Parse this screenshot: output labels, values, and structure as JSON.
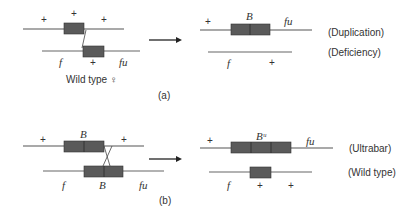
{
  "colors": {
    "line": "#666666",
    "box": "#5a5a5a",
    "box_border": "#333333",
    "text": "#333333"
  },
  "panel_a": {
    "label": "(a)",
    "caption": "Wild type ♀",
    "left": {
      "top_markers": [
        "+",
        "+",
        "+"
      ],
      "bottom_markers": [
        "f",
        "+",
        "fu"
      ]
    },
    "right": {
      "top_markers": [
        "+",
        "B",
        "fu"
      ],
      "bottom_markers": [
        "f",
        "+"
      ],
      "top_result": "(Duplication)",
      "bottom_result": "(Deficiency)"
    }
  },
  "panel_b": {
    "label": "(b)",
    "left": {
      "top_markers": [
        "+",
        "B",
        "+"
      ],
      "bottom_markers": [
        "f",
        "B",
        "fu"
      ]
    },
    "right": {
      "top_markers": [
        "+",
        "Bᵘ",
        "fu"
      ],
      "bottom_markers": [
        "f",
        "+",
        "+"
      ],
      "top_result": "(Ultrabar)",
      "bottom_result": "(Wild type)"
    }
  }
}
